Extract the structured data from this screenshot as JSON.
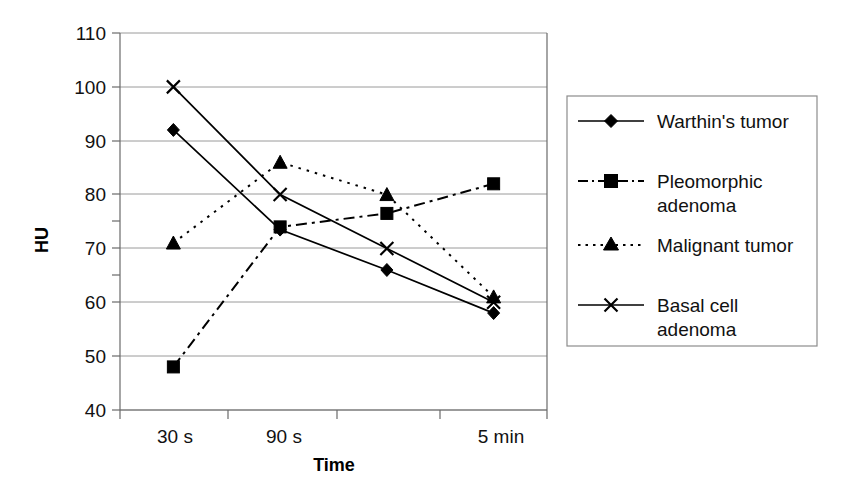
{
  "chart_data": {
    "type": "line",
    "title": "",
    "xlabel": "Time",
    "ylabel": "HU",
    "categories": [
      "30 s",
      "90 s",
      "",
      "5 min"
    ],
    "x_tick_labels": [
      "30 s",
      "90 s",
      "",
      "5 min"
    ],
    "y_tick_labels": [
      "40",
      "50",
      "60",
      "70",
      "80",
      "90",
      "100",
      "110"
    ],
    "ylim": [
      40,
      110
    ],
    "y_tick_step": 10,
    "grid": "horizontal",
    "legend_position": "right",
    "series": [
      {
        "name": "Warthin's tumor",
        "marker": "diamond",
        "line_style": "solid",
        "color": "#000000",
        "values": [
          92,
          73.5,
          66,
          58
        ]
      },
      {
        "name": "Pleomorphic adenoma",
        "marker": "square",
        "line_style": "dash-dot",
        "color": "#000000",
        "values": [
          48,
          74,
          76.5,
          82
        ]
      },
      {
        "name": "Malignant tumor",
        "marker": "triangle",
        "line_style": "dotted",
        "color": "#000000",
        "values": [
          71,
          86,
          80,
          61
        ]
      },
      {
        "name": "Basal cell adenoma",
        "marker": "x",
        "line_style": "solid",
        "color": "#000000",
        "values": [
          100,
          80,
          70,
          60
        ]
      }
    ]
  },
  "legend": {
    "entries": [
      {
        "label": "Warthin's tumor",
        "label_line2": ""
      },
      {
        "label": "Pleomorphic",
        "label_line2": "adenoma"
      },
      {
        "label": "Malignant tumor",
        "label_line2": ""
      },
      {
        "label": "Basal cell",
        "label_line2": "adenoma"
      }
    ]
  },
  "axes": {
    "y_title": "HU",
    "x_title": "Time"
  }
}
